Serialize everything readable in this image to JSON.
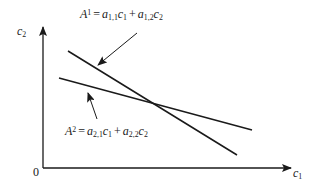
{
  "diagram": {
    "type": "two-line intersection on c1-c2 plane",
    "axes": {
      "x": {
        "label_base": "c",
        "label_sub": "1"
      },
      "y": {
        "label_base": "c",
        "label_sub": "2"
      },
      "origin_label": "0"
    },
    "lines": [
      {
        "id": "A1",
        "equation": {
          "lhs_base": "A",
          "lhs_sup": "1",
          "eq": "=",
          "t1_coef_base": "a",
          "t1_coef_sub": "1,1",
          "t1_var_base": "c",
          "t1_var_sub": "1",
          "plus": "+",
          "t2_coef_base": "a",
          "t2_coef_sub": "1,2",
          "t2_var_base": "c",
          "t2_var_sub": "2"
        },
        "slope": "steep"
      },
      {
        "id": "A2",
        "equation": {
          "lhs_base": "A",
          "lhs_sup": "2",
          "eq": "=",
          "t1_coef_base": "a",
          "t1_coef_sub": "2,1",
          "t1_var_base": "c",
          "t1_var_sub": "1",
          "plus": "+",
          "t2_coef_base": "a",
          "t2_coef_sub": "2,2",
          "t2_var_base": "c",
          "t2_var_sub": "2"
        },
        "slope": "shallow"
      }
    ],
    "colors": {
      "line": "#1a1a1a",
      "background": "#ffffff"
    }
  }
}
